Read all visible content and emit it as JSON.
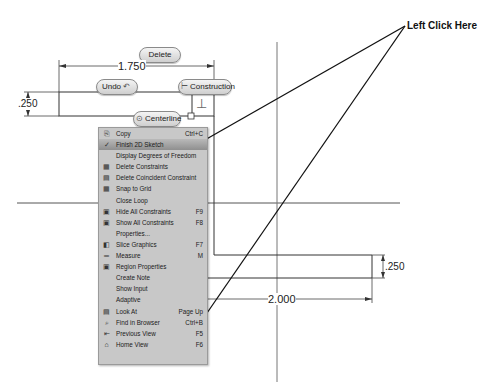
{
  "sketch": {
    "buttons": {
      "delete": "Delete",
      "undo": "Undo",
      "construction": "Construction",
      "centerline": "Centerline"
    },
    "dimensions": {
      "top_width": "1.750",
      "left_height": ".250",
      "right_height": ".250",
      "bottom_width": "2.000"
    },
    "callout": "Left Click Here"
  },
  "context_menu": {
    "items": [
      {
        "label": "Copy",
        "shortcut": "Ctrl+C",
        "icon": "copy-icon",
        "glyph": "⎘"
      },
      {
        "label": "Finish 2D Sketch",
        "shortcut": "",
        "icon": "finish-sketch-icon",
        "glyph": "✓",
        "highlighted": true
      },
      {
        "label": "Display Degrees of Freedom",
        "shortcut": "",
        "icon": "",
        "glyph": ""
      },
      {
        "label": "Delete Constraints",
        "shortcut": "",
        "icon": "delete-constraints-icon",
        "glyph": "▦"
      },
      {
        "label": "Delete Coincident Constraint",
        "shortcut": "",
        "icon": "delete-coincident-icon",
        "glyph": "▤"
      },
      {
        "label": "Snap to Grid",
        "shortcut": "",
        "icon": "snap-grid-icon",
        "glyph": "▦"
      },
      {
        "label": "Close Loop",
        "shortcut": "",
        "icon": "",
        "glyph": ""
      },
      {
        "label": "Hide All Constraints",
        "shortcut": "F9",
        "icon": "hide-constraints-icon",
        "glyph": "▣"
      },
      {
        "label": "Show All Constraints",
        "shortcut": "F8",
        "icon": "show-constraints-icon",
        "glyph": "▣"
      },
      {
        "label": "Properties...",
        "shortcut": "",
        "icon": "",
        "glyph": ""
      },
      {
        "label": "Slice Graphics",
        "shortcut": "F7",
        "icon": "slice-graphics-icon",
        "glyph": "◧"
      },
      {
        "label": "Measure",
        "shortcut": "M",
        "icon": "measure-icon",
        "glyph": "═"
      },
      {
        "label": "Region Properties",
        "shortcut": "",
        "icon": "region-properties-icon",
        "glyph": "▣"
      },
      {
        "label": "Create Note",
        "shortcut": "",
        "icon": "",
        "glyph": ""
      },
      {
        "label": "Show Input",
        "shortcut": "",
        "icon": "",
        "glyph": ""
      },
      {
        "label": "Adaptive",
        "shortcut": "",
        "icon": "",
        "glyph": ""
      },
      {
        "label": "Look At",
        "shortcut": "Page Up",
        "icon": "look-at-icon",
        "glyph": "▤"
      },
      {
        "label": "Find in Browser",
        "shortcut": "Ctrl+B",
        "icon": "find-browser-icon",
        "glyph": "⌕"
      },
      {
        "label": "Previous View",
        "shortcut": "F5",
        "icon": "previous-view-icon",
        "glyph": "⇤"
      },
      {
        "label": "Home View",
        "shortcut": "F6",
        "icon": "home-view-icon",
        "glyph": "⌂"
      }
    ]
  }
}
